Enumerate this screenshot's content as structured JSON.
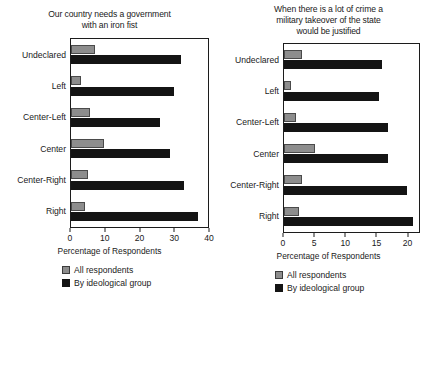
{
  "chart_data": [
    {
      "type": "bar",
      "orientation": "horizontal",
      "title": "Our country needs a government with an iron fist",
      "title_lines": [
        "Our country needs a government",
        "with an iron fist"
      ],
      "xlabel": "Percentage of Respondents",
      "ylabel": "",
      "xlim": [
        0,
        40
      ],
      "xticks": [
        0,
        10,
        20,
        30,
        40
      ],
      "xticklabels": [
        "0",
        "10",
        "20",
        "30",
        "40"
      ],
      "grid": false,
      "legend_position": "below",
      "categories": [
        "Undeclared",
        "Left",
        "Center-Left",
        "Center",
        "Center-Right",
        "Right"
      ],
      "series": [
        {
          "name": "All respondents",
          "color": "#8d8d8d",
          "values": [
            7,
            3,
            5.5,
            9.5,
            5,
            4
          ]
        },
        {
          "name": "By ideological group",
          "color": "#141414",
          "values": [
            32,
            30,
            26,
            29,
            33,
            37
          ]
        }
      ]
    },
    {
      "type": "bar",
      "orientation": "horizontal",
      "title": "When there is a lot of crime a military takeover of the state would be justified",
      "title_lines": [
        "When there is a lot of crime a",
        "military takeover of the state",
        "would be justified"
      ],
      "xlabel": "Percentage of Respondents",
      "ylabel": "",
      "xlim": [
        0,
        22
      ],
      "xticks": [
        0,
        5,
        10,
        15,
        20
      ],
      "xticklabels": [
        "0",
        "5",
        "10",
        "15",
        "20"
      ],
      "grid": false,
      "legend_position": "below",
      "categories": [
        "Undeclared",
        "Left",
        "Center-Left",
        "Center",
        "Center-Right",
        "Right"
      ],
      "series": [
        {
          "name": "All respondents",
          "color": "#8d8d8d",
          "values": [
            3,
            1.2,
            2,
            5,
            3,
            2.5
          ]
        },
        {
          "name": "By ideological group",
          "color": "#141414",
          "values": [
            16,
            15.5,
            17,
            17,
            20,
            21
          ]
        }
      ]
    }
  ],
  "left": {
    "title_line1": "Our country needs a government",
    "title_line2": "with an iron fist",
    "axis_title": "Percentage of Respondents",
    "legend": {
      "all_label": "All respondents",
      "ideo_label": "By ideological group"
    }
  },
  "right": {
    "title_line1": "When there is a lot of crime a",
    "title_line2": "military takeover of the state",
    "title_line3": "would be justified",
    "axis_title": "Percentage of Respondents",
    "legend": {
      "all_label": "All respondents",
      "ideo_label": "By ideological group"
    }
  }
}
